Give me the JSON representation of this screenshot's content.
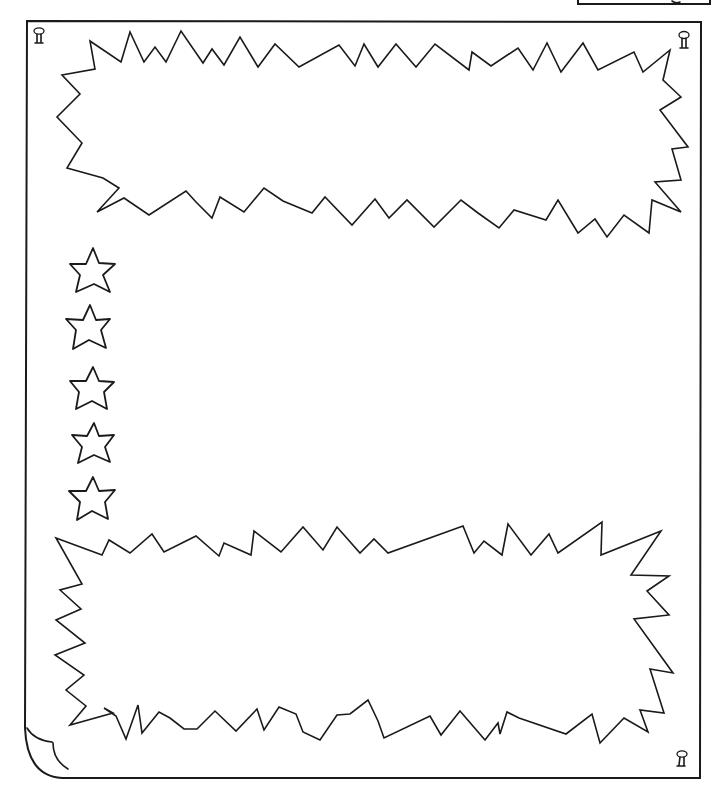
{
  "page": {
    "type": "bulletin-board-worksheet",
    "background": "#ffffff",
    "ink_color": "#1a1a1a"
  },
  "board": {
    "pins": [
      {
        "name": "pin-top-left",
        "x": 39,
        "y": 37
      },
      {
        "name": "pin-top-right",
        "x": 684,
        "y": 40
      },
      {
        "name": "pin-bottom-right",
        "x": 682,
        "y": 760
      }
    ],
    "curled_corner": "bottom-left"
  },
  "bursts": [
    {
      "name": "top-burst",
      "text": ""
    },
    {
      "name": "bottom-burst",
      "text": ""
    }
  ],
  "stars": {
    "count": 5,
    "items": [
      {
        "cx": 92,
        "cy": 268
      },
      {
        "cx": 88,
        "cy": 326
      },
      {
        "cx": 92,
        "cy": 386
      },
      {
        "cx": 93,
        "cy": 441
      },
      {
        "cx": 92,
        "cy": 496
      }
    ]
  },
  "top_right_box": {
    "partial": true
  }
}
